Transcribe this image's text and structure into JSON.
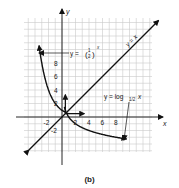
{
  "caption": "(b)",
  "chart_data": {
    "type": "line",
    "title": "",
    "xlabel": "x",
    "ylabel": "y",
    "xlim": [
      -4,
      10
    ],
    "ylim": [
      -5,
      10
    ],
    "grid": true,
    "x_ticks": [
      "-2",
      "2",
      "4",
      "6",
      "8"
    ],
    "y_ticks": [
      "8",
      "6",
      "4",
      "2",
      "-2"
    ],
    "series": [
      {
        "name": "y = (1/2)^x",
        "x": [
          -3.2,
          -3,
          -2,
          -1,
          0,
          1,
          2,
          3
        ],
        "y": [
          9.2,
          8,
          4,
          2,
          1,
          0.5,
          0.25,
          0.125
        ]
      },
      {
        "name": "y = log_{1/2} x",
        "x": [
          0.125,
          0.25,
          0.5,
          1,
          2,
          4,
          8,
          9.2
        ],
        "y": [
          3,
          2,
          1,
          0,
          -1,
          -2,
          -3,
          -3.2
        ]
      },
      {
        "name": "y = x",
        "x": [
          -4,
          10
        ],
        "y": [
          -4,
          10
        ]
      }
    ],
    "annotations": [
      {
        "text": "y = (1/2)^x",
        "arrow_to": [
          -2.5,
          6.8
        ]
      },
      {
        "text": "y = log_{1/2} x",
        "arrow_to": [
          6.8,
          -2.8
        ]
      },
      {
        "text": "y = x",
        "position": "along line, upper right"
      }
    ],
    "unit_vectors": [
      {
        "from": [
          0.5,
          0.5
        ],
        "to": [
          0.5,
          3
        ]
      },
      {
        "from": [
          0.5,
          0.5
        ],
        "to": [
          3,
          0.5
        ]
      }
    ]
  },
  "labels": {
    "x_axis": "x",
    "y_axis": "y",
    "exp_label": "y = ",
    "exp_base_num": "1",
    "exp_base_den": "2",
    "exp_power": "x",
    "log_label": "y = log",
    "log_sub": "1/2",
    "log_arg": "x",
    "identity_label": "y = x"
  }
}
